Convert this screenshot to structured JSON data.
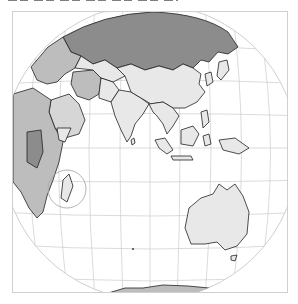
{
  "figure": {
    "type": "map",
    "projection": "orthographic",
    "center": {
      "label": "Indian Ocean / South Asia"
    },
    "caption_visible": false,
    "highlight": {
      "shape": "circle",
      "target": "Madagascar"
    },
    "regions_shown": [
      "Russia",
      "Europe",
      "Middle East",
      "Africa",
      "Iran",
      "India",
      "China",
      "Southeast Asia",
      "Indonesia",
      "Australia",
      "Madagascar",
      "Antarctica",
      "Japan"
    ],
    "colors": {
      "frame": "#d0d0d0",
      "graticule": "#c8c8c8",
      "land_light": "#e8e8e8",
      "land_mid": "#bdbdbd",
      "land_dark": "#8c8c8c",
      "border": "#222222",
      "ocean": "#ffffff"
    }
  }
}
